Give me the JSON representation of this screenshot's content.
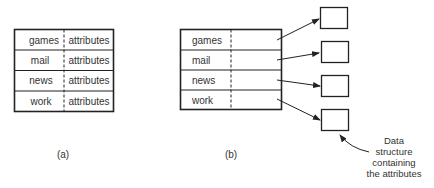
{
  "figure_a": {
    "caption": "(a)",
    "rows": [
      {
        "key": "games",
        "value": "attributes"
      },
      {
        "key": "mail",
        "value": "attributes"
      },
      {
        "key": "news",
        "value": "attributes"
      },
      {
        "key": "work",
        "value": "attributes"
      }
    ]
  },
  "figure_b": {
    "caption": "(b)",
    "rows": [
      {
        "key": "games"
      },
      {
        "key": "mail"
      },
      {
        "key": "news"
      },
      {
        "key": "work"
      }
    ],
    "annotation": {
      "line1": "Data",
      "line2": "structure",
      "line3": "containing",
      "line4": "the attributes"
    }
  },
  "colors": {
    "stroke": "#222222",
    "text": "#333333",
    "background": "#ffffff"
  }
}
